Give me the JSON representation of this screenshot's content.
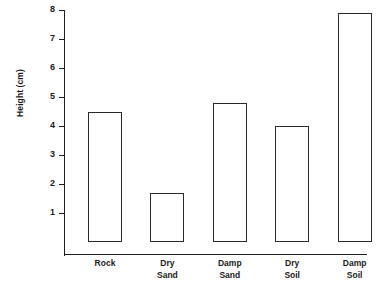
{
  "chart_data": {
    "type": "bar",
    "title": "",
    "subtitle": "",
    "xlabel": "",
    "ylabel": "Height (cm)",
    "categories": [
      "Rock",
      "Dry Sand",
      "Damp Sand",
      "Dry Soil",
      "Damp Soil"
    ],
    "category_lines": [
      [
        "Rock"
      ],
      [
        "Dry",
        "Sand"
      ],
      [
        "Damp",
        "Sand"
      ],
      [
        "Dry",
        "Soil"
      ],
      [
        "Damp",
        "Soil"
      ]
    ],
    "values": [
      4.5,
      1.7,
      4.8,
      4.0,
      7.9
    ],
    "ylim": [
      0,
      8
    ],
    "ytick_labels": [
      "8",
      "7",
      "6",
      "5",
      "4",
      "3",
      "2",
      "1"
    ],
    "ytick_values": [
      8,
      7,
      6,
      5,
      4,
      3,
      2,
      1
    ],
    "grid": false,
    "legend": null,
    "bar_fill_color": "#ffffff",
    "bar_edge_color": "#2a2a2a",
    "axis_color": "#1d1d1d",
    "background_color": "#ffffff"
  }
}
